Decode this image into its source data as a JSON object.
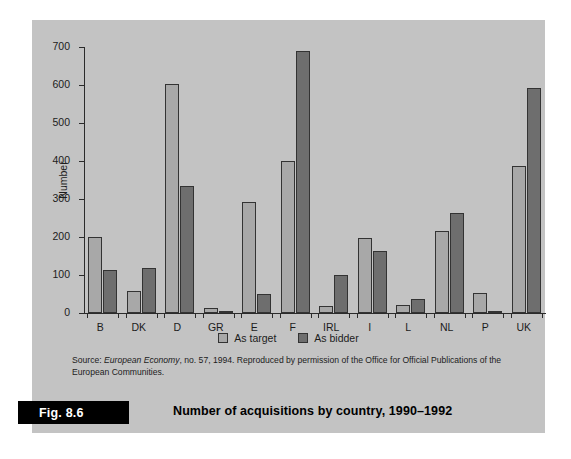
{
  "figure": {
    "number_label": "Fig. 8.6",
    "caption": "Number of acquisitions by country, 1990–1992",
    "source_prefix": "Source: ",
    "source_italic": "European Economy",
    "source_rest": ", no. 57, 1994. Reproduced by permission of the Office for Official Publications of the European Communities."
  },
  "colors": {
    "panel_background": "#c3c3c3",
    "series_target": "#a8a8a8",
    "series_bidder": "#6e6e6e",
    "axis": "#2b2b2b",
    "badge_background": "#000000",
    "badge_text": "#ffffff"
  },
  "chart_data": {
    "type": "bar",
    "title": "Number of acquisitions by country, 1990–1992",
    "xlabel": "",
    "ylabel": "Number",
    "ylim": [
      0,
      700
    ],
    "yticks": [
      0,
      100,
      200,
      300,
      400,
      500,
      600,
      700
    ],
    "ytick_labels": [
      "0",
      "100",
      "200",
      "300",
      "400",
      "500",
      "600",
      "700"
    ],
    "grid": false,
    "legend_position": "bottom-center",
    "categories": [
      "B",
      "DK",
      "D",
      "GR",
      "E",
      "F",
      "IRL",
      "I",
      "L",
      "NL",
      "P",
      "UK"
    ],
    "series": [
      {
        "name": "As target",
        "color": "#a8a8a8",
        "values": [
          200,
          58,
          603,
          13,
          292,
          400,
          18,
          198,
          20,
          217,
          52,
          388
        ]
      },
      {
        "name": "As bidder",
        "color": "#6e6e6e",
        "values": [
          113,
          118,
          335,
          4,
          50,
          690,
          100,
          163,
          38,
          262,
          5,
          593
        ]
      }
    ]
  }
}
